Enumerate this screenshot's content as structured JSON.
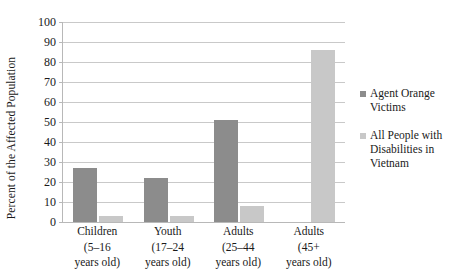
{
  "chart_data": {
    "type": "bar",
    "title": "",
    "subtitle": "",
    "xlabel": "",
    "ylabel": "Percent of the Affected Population",
    "ylim": [
      0,
      100
    ],
    "ytick_step": 10,
    "yticks": [
      100,
      90,
      80,
      70,
      60,
      50,
      40,
      30,
      20,
      10,
      0
    ],
    "grid": true,
    "legend_position": "right",
    "categories": [
      "Children\n(5–16\nyears old)",
      "Youth\n(17–24\nyears old)",
      "Adults\n(25–44\nyears old)",
      "Adults\n(45+\nyears old)"
    ],
    "category_lines": [
      [
        "Children",
        "(5–16",
        "years old)"
      ],
      [
        "Youth",
        "(17–24",
        "years old)"
      ],
      [
        "Adults",
        "(25–44",
        "years old)"
      ],
      [
        "Adults",
        "(45+",
        "years old)"
      ]
    ],
    "series": [
      {
        "name": "Agent Orange Victims",
        "color": "#8c8c8c",
        "legend_lines": [
          "Agent Orange",
          "Victims"
        ],
        "values": [
          27,
          22,
          51,
          0
        ]
      },
      {
        "name": "All People with Disabilities in Vietnam",
        "color": "#c8c8c8",
        "legend_lines": [
          "All People with",
          "Disabilities in",
          "Vietnam"
        ],
        "values": [
          3,
          3,
          8,
          86
        ]
      }
    ]
  },
  "colors": {
    "series_dark": "#8c8c8c",
    "series_light": "#c8c8c8",
    "gridline": "#c9c9c9",
    "axis": "#b8b8b8",
    "text": "#1a1a1a",
    "background": "#ffffff"
  }
}
